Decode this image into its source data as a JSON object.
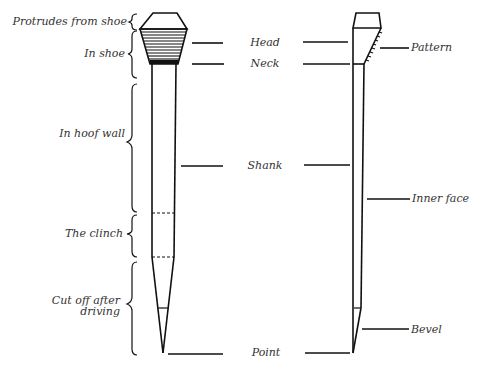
{
  "figure": {
    "type": "horseshoe-nail-anatomy",
    "left_brace_labels": [
      {
        "id": "protrudes",
        "text": "Protrudes from shoe"
      },
      {
        "id": "in_shoe",
        "text": "In shoe"
      },
      {
        "id": "in_hoof_wall",
        "text": "In hoof wall"
      },
      {
        "id": "clinch",
        "text": "The clinch"
      },
      {
        "id": "cut_off_1",
        "text": "Cut off after"
      },
      {
        "id": "cut_off_2",
        "text": "driving"
      }
    ],
    "center_labels": [
      {
        "id": "head",
        "text": "Head"
      },
      {
        "id": "neck",
        "text": "Neck"
      },
      {
        "id": "shank",
        "text": "Shank"
      },
      {
        "id": "point",
        "text": "Point"
      }
    ],
    "right_labels": [
      {
        "id": "pattern",
        "text": "Pattern"
      },
      {
        "id": "inner_face",
        "text": "Inner face"
      },
      {
        "id": "bevel",
        "text": "Bevel"
      }
    ],
    "colors": {
      "ink": "#111111",
      "label": "#333333",
      "background": "#ffffff"
    }
  }
}
